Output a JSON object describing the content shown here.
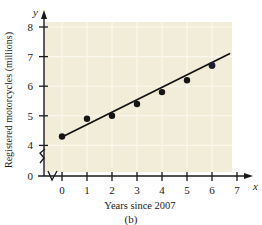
{
  "figure": {
    "caption": "(b)",
    "plot_bg_color": "#f1edd9",
    "grid_color": "#fbf9ee",
    "axis_color": "#1a1a1a",
    "point_color": "#151515",
    "line_color": "#101010"
  },
  "chart_data": {
    "type": "scatter",
    "title": "",
    "subtitle": "",
    "xlabel": "Years since 2007",
    "ylabel": "Registered motorcycles (millions)",
    "x_axis_symbol": "x",
    "y_axis_symbol": "y",
    "x": [
      0,
      1,
      2,
      3,
      4,
      5,
      6
    ],
    "values": [
      4.3,
      4.9,
      5.0,
      5.4,
      5.8,
      6.2,
      6.7
    ],
    "categories": [
      "0",
      "1",
      "2",
      "3",
      "4",
      "5",
      "6"
    ],
    "xlim": [
      0,
      7
    ],
    "ylim": [
      4,
      8
    ],
    "y_axis_break": true,
    "x_axis_break": true,
    "xticks": [
      "0",
      "1",
      "2",
      "3",
      "4",
      "5",
      "6",
      "7"
    ],
    "yticks": [
      "0",
      "4",
      "5",
      "6",
      "7",
      "8"
    ],
    "grid": true,
    "legend": "none",
    "series": [
      {
        "name": "Registered motorcycles",
        "type": "scatter",
        "values": [
          4.3,
          4.9,
          5.0,
          5.4,
          5.8,
          6.2,
          6.7
        ]
      },
      {
        "name": "trend line",
        "type": "line",
        "x_start": 0,
        "y_start": 4.28,
        "x_end": 6.7,
        "y_end": 7.1
      }
    ],
    "annotations": []
  }
}
